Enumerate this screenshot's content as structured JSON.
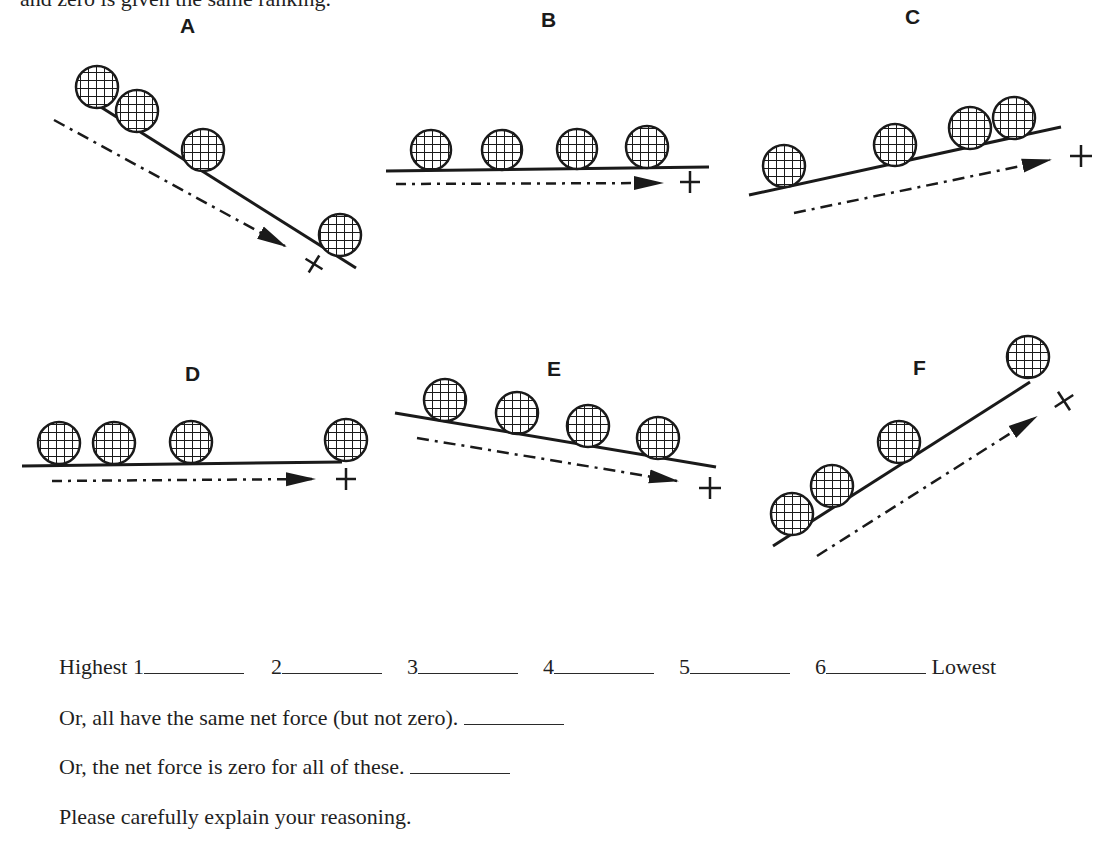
{
  "top_fragment": "and zero is given the same ranking.",
  "diagrams": [
    {
      "id": "A",
      "label": "A",
      "ball_count": 4,
      "incline": "downhill-right",
      "positive_direction": "down-slope"
    },
    {
      "id": "B",
      "label": "B",
      "ball_count": 4,
      "incline": "horizontal",
      "positive_direction": "right"
    },
    {
      "id": "C",
      "label": "C",
      "ball_count": 4,
      "incline": "uphill-right",
      "positive_direction": "up-slope"
    },
    {
      "id": "D",
      "label": "D",
      "ball_count": 4,
      "incline": "horizontal",
      "positive_direction": "right"
    },
    {
      "id": "E",
      "label": "E",
      "ball_count": 4,
      "incline": "downhill-right",
      "positive_direction": "down-slope"
    },
    {
      "id": "F",
      "label": "F",
      "ball_count": 4,
      "incline": "uphill-right",
      "positive_direction": "up-slope"
    }
  ],
  "sign_symbol": "+",
  "ranking": {
    "highest_label": "Highest",
    "lowest_label": "Lowest",
    "slots": [
      "1",
      "2",
      "3",
      "4",
      "5",
      "6"
    ]
  },
  "alternatives": [
    "Or, all have the same net force (but not zero).",
    "Or, the net force is zero for all of these."
  ],
  "instruction": "Please carefully explain your reasoning."
}
